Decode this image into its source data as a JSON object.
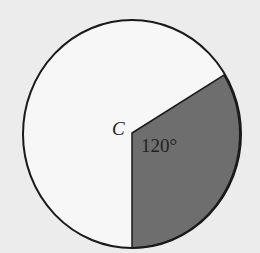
{
  "diagram": {
    "center_label": "C",
    "sector_angle_label": "120°",
    "colors": {
      "background": "#ececec",
      "circle_fill": "#f7f7f7",
      "sector_fill": "#6e6e6e",
      "stroke": "#1a1a1a"
    }
  }
}
